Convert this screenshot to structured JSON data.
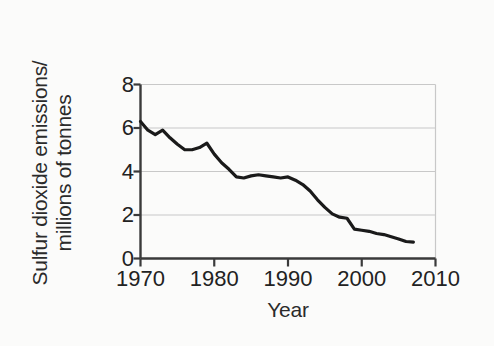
{
  "chart_data": {
    "type": "line",
    "title": "",
    "xlabel": "Year",
    "ylabel": "Sulfur dioxide emissions/ millions of tonnes",
    "ylabel_lines": [
      "Sulfur dioxide emissions/",
      "millions of tonnes"
    ],
    "xlim": [
      1970,
      2010
    ],
    "ylim": [
      0,
      8
    ],
    "xticks": [
      1970,
      1980,
      1990,
      2000,
      2010
    ],
    "xtick_labels": [
      "1970",
      "1980",
      "1990",
      "2000",
      "2010"
    ],
    "yticks": [
      0,
      2,
      4,
      6,
      8
    ],
    "ytick_labels": [
      "0",
      "2",
      "4",
      "6",
      "8"
    ],
    "grid": "horizontal",
    "legend": "none",
    "line_color": "#1a1a1a",
    "line_width": 3.2,
    "grid_color": "#c8c8c8",
    "axis_color": "#3a3a3a",
    "background": "#fbfbfa",
    "series": [
      {
        "name": "Sulfur dioxide emissions",
        "units": "millions of tonnes",
        "x": [
          1970,
          1971,
          1972,
          1973,
          1974,
          1975,
          1976,
          1977,
          1978,
          1979,
          1980,
          1981,
          1982,
          1983,
          1984,
          1985,
          1986,
          1987,
          1988,
          1989,
          1990,
          1991,
          1992,
          1993,
          1994,
          1995,
          1996,
          1997,
          1998,
          1999,
          2000,
          2001,
          2002,
          2003,
          2004,
          2005,
          2006,
          2007
        ],
        "values": [
          6.3,
          5.9,
          5.7,
          5.9,
          5.55,
          5.25,
          5.0,
          5.0,
          5.1,
          5.3,
          4.8,
          4.4,
          4.1,
          3.75,
          3.7,
          3.8,
          3.85,
          3.8,
          3.75,
          3.7,
          3.75,
          3.6,
          3.4,
          3.1,
          2.7,
          2.35,
          2.05,
          1.9,
          1.85,
          1.35,
          1.3,
          1.25,
          1.15,
          1.1,
          1.0,
          0.9,
          0.78,
          0.75
        ]
      }
    ]
  }
}
